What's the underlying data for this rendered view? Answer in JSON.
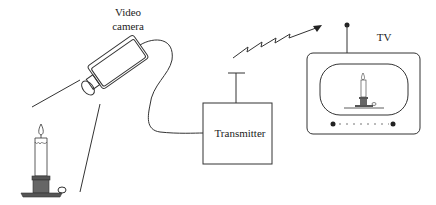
{
  "diagram": {
    "type": "block-diagram",
    "labels": {
      "camera_line1": "Video",
      "camera_line2": "camera",
      "transmitter": "Transmitter",
      "tv": "TV"
    },
    "nodes": [
      {
        "id": "candle",
        "label": ""
      },
      {
        "id": "video-camera",
        "label": "Video camera"
      },
      {
        "id": "transmitter",
        "label": "Transmitter"
      },
      {
        "id": "tv",
        "label": "TV"
      }
    ],
    "edges": [
      {
        "from": "candle",
        "to": "video-camera",
        "kind": "field-of-view"
      },
      {
        "from": "video-camera",
        "to": "transmitter",
        "kind": "cable"
      },
      {
        "from": "transmitter",
        "to": "tv",
        "kind": "wireless-signal"
      }
    ],
    "colors": {
      "line": "#333333",
      "fill_dark": "#555555",
      "background": "#ffffff"
    }
  }
}
